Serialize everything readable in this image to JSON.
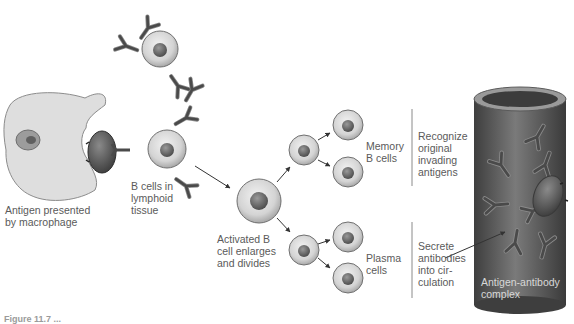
{
  "figure": {
    "caption": "Figure 11.7 ...",
    "colors": {
      "background": "#ffffff",
      "cell_fill": "#d6d6d6",
      "cell_edge": "#707070",
      "nucleus": "#6e6e6e",
      "antibody": "#4a4a4a",
      "vessel": "#5e5e5e",
      "vessel_highlight": "#8a8a8a",
      "macrophage": "#dcdcdc",
      "antigen": "#555555",
      "label_text": "#5a5a5a"
    }
  },
  "labels": {
    "macrophage": "Antigen presented\nby macrophage",
    "b_cells": "B cells in\nlymphoid\ntissue",
    "activated": "Activated B\ncell enlarges\nand divides",
    "memory": "Memory\nB cells",
    "memory_role": "Recognize\noriginal\ninvading\nantigens",
    "plasma": "Plasma\ncells",
    "plasma_role": "Secrete\nantibodies\ninto cir-\nculation",
    "complex": "Antigen-antibody\ncomplex"
  },
  "stages": [
    {
      "id": "macrophage",
      "name": "Antigen presented by macrophage"
    },
    {
      "id": "b-cell",
      "name": "B cells in lymphoid tissue"
    },
    {
      "id": "activated",
      "name": "Activated B cell enlarges and divides"
    },
    {
      "id": "memory",
      "name": "Memory B cells",
      "role": "Recognize original invading antigens"
    },
    {
      "id": "plasma",
      "name": "Plasma cells",
      "role": "Secrete antibodies into circulation"
    },
    {
      "id": "complex",
      "name": "Antigen-antibody complex"
    }
  ]
}
